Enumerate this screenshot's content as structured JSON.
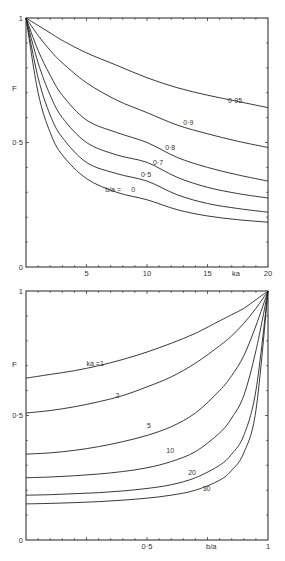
{
  "chart_data": [
    {
      "type": "line",
      "title": "",
      "xlabel": "ka",
      "ylabel": "F",
      "xlim": [
        0,
        20
      ],
      "ylim": [
        0,
        1
      ],
      "xticks": [
        5,
        10,
        15,
        20
      ],
      "xtick_labels": [
        "5",
        "10",
        "15",
        "20"
      ],
      "yticks": [
        0,
        0.5,
        1
      ],
      "ytick_labels": [
        "0",
        "0·5",
        "1"
      ],
      "grid": false,
      "legend": "inline curve labels",
      "series_label_prefix": "b/a =",
      "x": [
        0,
        1,
        2,
        3,
        5,
        7.5,
        10,
        12.5,
        15,
        17.5,
        20
      ],
      "series": [
        {
          "name": "0.95",
          "label": "0·95",
          "values": [
            1.0,
            0.97,
            0.94,
            0.91,
            0.86,
            0.81,
            0.76,
            0.72,
            0.69,
            0.665,
            0.64
          ],
          "label_at": [
            16.7,
            0.66
          ]
        },
        {
          "name": "0.9",
          "label": "0·9",
          "values": [
            1.0,
            0.93,
            0.87,
            0.82,
            0.74,
            0.67,
            0.62,
            0.57,
            0.535,
            0.505,
            0.48
          ],
          "label_at": [
            13.0,
            0.57
          ]
        },
        {
          "name": "0.8",
          "label": "0·8",
          "values": [
            1.0,
            0.87,
            0.77,
            0.69,
            0.59,
            0.54,
            0.5,
            0.44,
            0.4,
            0.37,
            0.345
          ],
          "label_at": [
            11.5,
            0.47
          ]
        },
        {
          "name": "0.7",
          "label": "0·7",
          "values": [
            1.0,
            0.82,
            0.69,
            0.6,
            0.5,
            0.45,
            0.42,
            0.36,
            0.32,
            0.295,
            0.277
          ],
          "label_at": [
            10.5,
            0.41
          ]
        },
        {
          "name": "0.5",
          "label": "0·5",
          "values": [
            1.0,
            0.76,
            0.61,
            0.52,
            0.42,
            0.375,
            0.345,
            0.29,
            0.255,
            0.235,
            0.22
          ],
          "label_at": [
            9.5,
            0.36
          ]
        },
        {
          "name": "0",
          "label": "0",
          "values": [
            1.0,
            0.7,
            0.54,
            0.45,
            0.355,
            0.3,
            0.27,
            0.23,
            0.205,
            0.19,
            0.18
          ],
          "label_at": [
            8.7,
            0.3
          ]
        }
      ],
      "series_label_text": "b/a ="
    },
    {
      "type": "line",
      "title": "",
      "xlabel": "b/a",
      "ylabel": "F",
      "xlim": [
        0,
        1
      ],
      "ylim": [
        0,
        1
      ],
      "xticks": [
        0.5,
        1
      ],
      "xtick_labels": [
        "0·5",
        "1"
      ],
      "yticks": [
        0,
        0.5,
        1
      ],
      "ytick_labels": [
        "0",
        "0·5",
        "1"
      ],
      "grid": false,
      "legend": "inline curve labels",
      "series_label_prefix": "ka =",
      "x": [
        0,
        0.1,
        0.2,
        0.3,
        0.4,
        0.5,
        0.6,
        0.7,
        0.8,
        0.85,
        0.9,
        0.95,
        1.0
      ],
      "series": [
        {
          "name": "1",
          "label": "ka =1",
          "values": [
            0.65,
            0.665,
            0.68,
            0.7,
            0.725,
            0.755,
            0.79,
            0.83,
            0.88,
            0.905,
            0.93,
            0.965,
            1.0
          ],
          "label_at": [
            0.25,
            0.7
          ]
        },
        {
          "name": "2",
          "label": "2",
          "values": [
            0.51,
            0.52,
            0.535,
            0.555,
            0.58,
            0.615,
            0.655,
            0.71,
            0.78,
            0.82,
            0.87,
            0.93,
            1.0
          ],
          "label_at": [
            0.37,
            0.57
          ]
        },
        {
          "name": "5",
          "label": "5",
          "values": [
            0.345,
            0.35,
            0.36,
            0.375,
            0.395,
            0.42,
            0.455,
            0.51,
            0.6,
            0.66,
            0.74,
            0.86,
            1.0
          ],
          "label_at": [
            0.5,
            0.45
          ]
        },
        {
          "name": "10",
          "label": "10",
          "values": [
            0.25,
            0.253,
            0.258,
            0.265,
            0.275,
            0.29,
            0.315,
            0.355,
            0.43,
            0.49,
            0.58,
            0.76,
            1.0
          ],
          "label_at": [
            0.58,
            0.35
          ]
        },
        {
          "name": "20",
          "label": "20",
          "values": [
            0.18,
            0.182,
            0.186,
            0.19,
            0.197,
            0.207,
            0.222,
            0.25,
            0.3,
            0.345,
            0.42,
            0.6,
            1.0
          ],
          "label_at": [
            0.67,
            0.26
          ]
        },
        {
          "name": "30",
          "label": "30",
          "values": [
            0.145,
            0.147,
            0.15,
            0.154,
            0.16,
            0.168,
            0.18,
            0.2,
            0.24,
            0.28,
            0.35,
            0.52,
            1.0
          ],
          "label_at": [
            0.73,
            0.195
          ]
        }
      ]
    }
  ]
}
